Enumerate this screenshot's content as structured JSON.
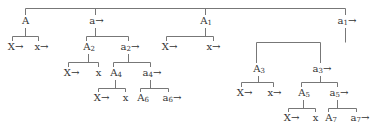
{
  "diagram": {
    "type": "tree",
    "line_color": "#777777",
    "text_color": "#333333",
    "nodes": [
      {
        "id": "A",
        "label": "A",
        "x": 25,
        "y": 16
      },
      {
        "id": "a",
        "label": "a→",
        "x": 95,
        "y": 16
      },
      {
        "id": "A1",
        "label": "A1",
        "x": 205,
        "y": 16
      },
      {
        "id": "a1",
        "label": "a1→",
        "x": 345,
        "y": 16
      },
      {
        "id": "A_X",
        "label": "X→",
        "x": 14,
        "y": 42
      },
      {
        "id": "A_x",
        "label": "x→",
        "x": 40,
        "y": 42
      },
      {
        "id": "A2",
        "label": "A2",
        "x": 88,
        "y": 42
      },
      {
        "id": "a2",
        "label": "a2→",
        "x": 128,
        "y": 42
      },
      {
        "id": "A1_X",
        "label": "X→",
        "x": 168,
        "y": 42
      },
      {
        "id": "A1_x",
        "label": "x→",
        "x": 212,
        "y": 42
      },
      {
        "id": "A3",
        "label": "A3",
        "x": 258,
        "y": 64
      },
      {
        "id": "a3",
        "label": "a3→",
        "x": 320,
        "y": 64
      },
      {
        "id": "A2_X",
        "label": "X→",
        "x": 70,
        "y": 68
      },
      {
        "id": "A2_x",
        "label": "x",
        "x": 98,
        "y": 68
      },
      {
        "id": "A4",
        "label": "A4",
        "x": 115,
        "y": 68
      },
      {
        "id": "a4",
        "label": "a4→",
        "x": 150,
        "y": 68
      },
      {
        "id": "A3_X",
        "label": "X→",
        "x": 243,
        "y": 88
      },
      {
        "id": "A3_x",
        "label": "x→",
        "x": 273,
        "y": 88
      },
      {
        "id": "A5",
        "label": "A5",
        "x": 303,
        "y": 88
      },
      {
        "id": "a5",
        "label": "a5→",
        "x": 337,
        "y": 88
      },
      {
        "id": "A4_X",
        "label": "X→",
        "x": 100,
        "y": 93
      },
      {
        "id": "A4_x",
        "label": "x",
        "x": 125,
        "y": 93
      },
      {
        "id": "A6",
        "label": "A6",
        "x": 142,
        "y": 93
      },
      {
        "id": "a6",
        "label": "a6→",
        "x": 170,
        "y": 93
      },
      {
        "id": "A5_X",
        "label": "X→",
        "x": 290,
        "y": 113
      },
      {
        "id": "A5_x",
        "label": "x",
        "x": 315,
        "y": 113
      },
      {
        "id": "A7",
        "label": "A7",
        "x": 330,
        "y": 113
      },
      {
        "id": "a7",
        "label": "a7→",
        "x": 358,
        "y": 113
      }
    ],
    "brackets": [
      {
        "parent": "root",
        "bar_y": 8,
        "from_y": 8,
        "children": [
          [
            25,
            15
          ],
          [
            95,
            15
          ],
          [
            205,
            15
          ],
          [
            345,
            15
          ]
        ]
      },
      {
        "parent": "A",
        "bar_y": 36,
        "from_y": 28,
        "px": 25,
        "children": [
          [
            12,
            41
          ],
          [
            38,
            41
          ]
        ]
      },
      {
        "parent": "a",
        "bar_y": 36,
        "from_y": 28,
        "px": 95,
        "children": [
          [
            86,
            41
          ],
          [
            128,
            41
          ]
        ]
      },
      {
        "parent": "A1",
        "bar_y": 36,
        "from_y": 28,
        "px": 205,
        "children": [
          [
            166,
            41
          ],
          [
            213,
            41
          ]
        ]
      },
      {
        "parent": "a1",
        "bar_y": 42,
        "from_y": 28,
        "px": 345,
        "children": [
          [
            256,
            63
          ],
          [
            320,
            63
          ]
        ]
      },
      {
        "parent": "A2",
        "bar_y": 62,
        "from_y": 54,
        "px": 88,
        "children": [
          [
            68,
            67
          ],
          [
            98,
            67
          ]
        ]
      },
      {
        "parent": "a2",
        "bar_y": 62,
        "from_y": 54,
        "px": 128,
        "children": [
          [
            113,
            67
          ],
          [
            150,
            67
          ]
        ]
      },
      {
        "parent": "A3",
        "bar_y": 82,
        "from_y": 76,
        "px": 258,
        "children": [
          [
            241,
            87
          ],
          [
            273,
            87
          ]
        ]
      },
      {
        "parent": "a3",
        "bar_y": 82,
        "from_y": 76,
        "px": 320,
        "children": [
          [
            301,
            87
          ],
          [
            337,
            87
          ]
        ]
      },
      {
        "parent": "A4",
        "bar_y": 88,
        "from_y": 80,
        "px": 115,
        "children": [
          [
            98,
            92
          ],
          [
            125,
            92
          ]
        ]
      },
      {
        "parent": "a4",
        "bar_y": 88,
        "from_y": 80,
        "px": 150,
        "children": [
          [
            140,
            92
          ],
          [
            168,
            92
          ]
        ]
      },
      {
        "parent": "A5",
        "bar_y": 108,
        "from_y": 100,
        "px": 303,
        "children": [
          [
            288,
            112
          ],
          [
            315,
            112
          ]
        ]
      },
      {
        "parent": "a5",
        "bar_y": 108,
        "from_y": 100,
        "px": 337,
        "children": [
          [
            328,
            112
          ],
          [
            356,
            112
          ]
        ]
      }
    ]
  }
}
